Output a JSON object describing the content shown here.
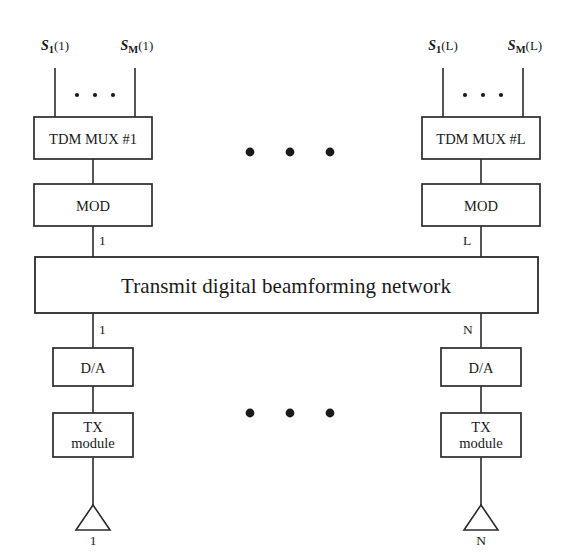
{
  "diagram": {
    "colors": {
      "background": "#ffffff",
      "stroke": "#2b2b2b",
      "text": "#1a1a1a"
    },
    "inputs": {
      "left": [
        {
          "name": "S",
          "subscript": "1",
          "index": "(1)"
        },
        {
          "name": "S",
          "subscript": "M",
          "index": "(1)"
        }
      ],
      "right": [
        {
          "name": "S",
          "subscript": "1",
          "index": "(L)"
        },
        {
          "name": "S",
          "subscript": "M",
          "index": "(L)"
        }
      ]
    },
    "columns": {
      "left": {
        "mux_label": "TDM MUX #1",
        "mod_label": "MOD",
        "mod_output_label": "1",
        "network_output_label": "1",
        "da_label": "D/A",
        "tx_label_line1": "TX",
        "tx_label_line2": "module",
        "antenna_label": "1"
      },
      "right": {
        "mux_label": "TDM MUX #L",
        "mod_label": "MOD",
        "mod_output_label": "L",
        "network_output_label": "N",
        "da_label": "D/A",
        "tx_label_line1": "TX",
        "tx_label_line2": "module",
        "antenna_label": "N"
      }
    },
    "network": {
      "label": "Transmit digital beamforming network"
    },
    "ellipses": {
      "between_columns_top": "three-dots",
      "between_columns_bottom": "three-dots",
      "left_inputs": "three-dots",
      "right_inputs": "three-dots"
    }
  }
}
